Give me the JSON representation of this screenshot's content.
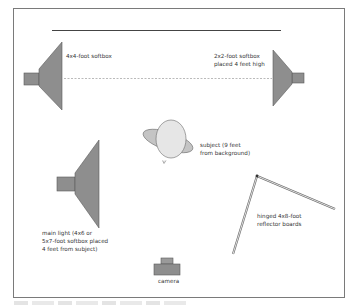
{
  "diagram": {
    "colors": {
      "frame": "#7a7a7a",
      "softbox_fill": "#8e8e8e",
      "softbox_stroke": "#5a5a5a",
      "subject_fill": "#e6e6e6",
      "subject_shoulders_fill": "#c4c4c4",
      "reflector": "#6a6a6a",
      "background_line": "#444444",
      "text": "#333333"
    },
    "labels": {
      "background": "",
      "softbox_left": "4x4-foot softbox",
      "softbox_right_line1": "2x2-foot softbox",
      "softbox_right_line2": "placed 4 feet high",
      "subject_line1": "subject (9 feet",
      "subject_line2": "from background)",
      "main_light_line1": "main light (4x6 or",
      "main_light_line2": "5x7-foot softbox placed",
      "main_light_line3": "4 feet from subject)",
      "reflector_line1": "hinged 4x8-foot",
      "reflector_line2": "reflector boards",
      "camera": "camera"
    },
    "icons": {
      "softbox": "softbox-trapezoid",
      "subject": "person-top-view",
      "reflector": "hinged-boards",
      "camera": "camera-top-view"
    }
  }
}
